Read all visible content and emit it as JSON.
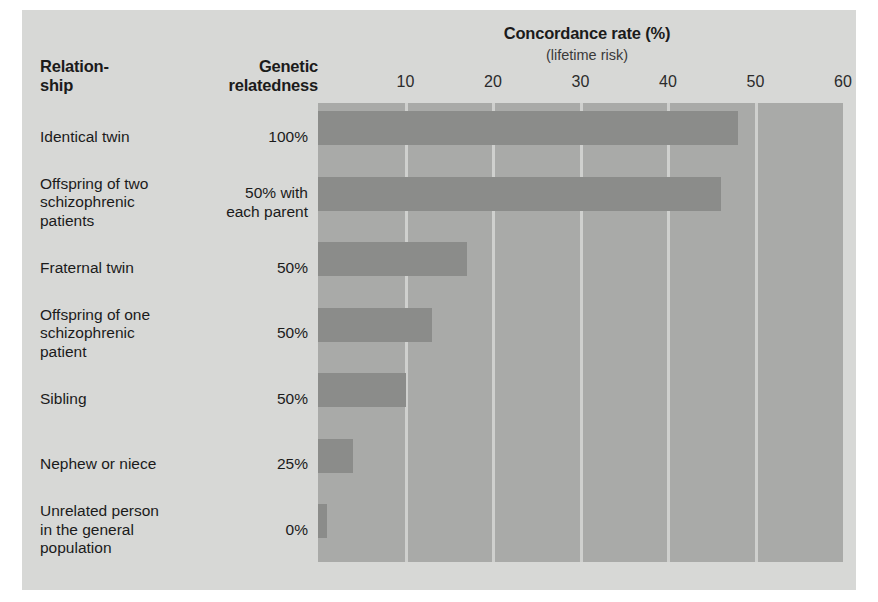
{
  "figure": {
    "background_color": "#d7d8d6",
    "plot_background_color": "#a9aaa8",
    "bar_color": "#8b8c8a",
    "gridline_color": "#cfd0ce"
  },
  "columns": {
    "relationship_header": "Relation-\nship",
    "relationship_header_line1": "Relation-",
    "relationship_header_line2": "ship",
    "genetic_header_line1": "Genetic",
    "genetic_header_line2": "relatedness"
  },
  "chart_data": {
    "type": "bar",
    "orientation": "horizontal",
    "title": "Concordance rate (%)",
    "subtitle": "(lifetime risk)",
    "xlabel": "",
    "ylabel": "",
    "xlim": [
      0,
      60
    ],
    "ticks": [
      10,
      20,
      30,
      40,
      50,
      60
    ],
    "grid": true,
    "legend": "none",
    "categories": [
      "Identical twin",
      "Offspring of two schizophrenic patients",
      "Fraternal twin",
      "Offspring of one schizophrenic patient",
      "Sibling",
      "Nephew or niece",
      "Unrelated person in the general population"
    ],
    "values": [
      48,
      46,
      17,
      13,
      10,
      4,
      1
    ],
    "genetic_relatedness": [
      "100%",
      "50% with each parent",
      "50%",
      "50%",
      "50%",
      "25%",
      "0%"
    ],
    "rows": [
      {
        "name_lines": [
          "Identical twin"
        ],
        "relatedness_lines": [
          "100%"
        ],
        "value": 48
      },
      {
        "name_lines": [
          "Offspring of two",
          "schizophrenic",
          "patients"
        ],
        "relatedness_lines": [
          "50% with",
          "each parent"
        ],
        "value": 46
      },
      {
        "name_lines": [
          "Fraternal twin"
        ],
        "relatedness_lines": [
          "50%"
        ],
        "value": 17
      },
      {
        "name_lines": [
          "Offspring of one",
          "schizophrenic",
          "patient"
        ],
        "relatedness_lines": [
          "50%"
        ],
        "value": 13
      },
      {
        "name_lines": [
          "Sibling"
        ],
        "relatedness_lines": [
          "50%"
        ],
        "value": 10
      },
      {
        "name_lines": [
          "Nephew or niece"
        ],
        "relatedness_lines": [
          "25%"
        ],
        "value": 4
      },
      {
        "name_lines": [
          "Unrelated person",
          "in the general",
          "population"
        ],
        "relatedness_lines": [
          "0%"
        ],
        "value": 1
      }
    ]
  }
}
